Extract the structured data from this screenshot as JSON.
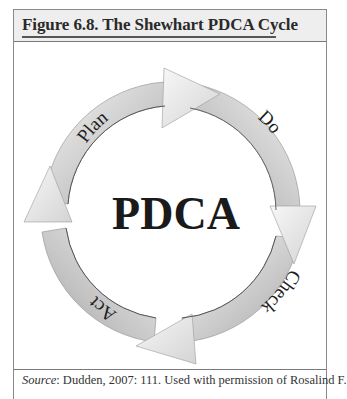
{
  "figure": {
    "title": "Figure 6.8.  The Shewhart PDCA Cycle",
    "center_label": "PDCA",
    "stages": [
      {
        "label": "Plan",
        "position": "upper-left"
      },
      {
        "label": "Do",
        "position": "upper-right"
      },
      {
        "label": "Check",
        "position": "lower-right"
      },
      {
        "label": "Act",
        "position": "lower-left"
      }
    ],
    "caption": {
      "prefix": "Source",
      "text": ": Dudden, 2007: 111. Used with permission of Rosalind F."
    },
    "colors": {
      "arrow_light": "#f2f2f2",
      "arrow_mid": "#c8c8c8",
      "arrow_dark": "#9a9a9a",
      "text": "#1e1e1e",
      "header_bg": "#eeeeee",
      "border": "#8a8a8a"
    }
  }
}
